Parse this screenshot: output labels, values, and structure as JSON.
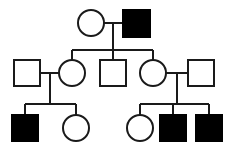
{
  "figure": {
    "type": "pedigree-chart",
    "title": "",
    "caption": "",
    "background_color": "#ffffff",
    "line_color": "#1a1a1a",
    "affected_fill": "#000000",
    "unaffected_fill": "#ffffff"
  },
  "legend": {
    "square_meaning": "male",
    "circle_meaning": "female",
    "filled_meaning": "affected",
    "open_meaning": "unaffected"
  },
  "generations": [
    {
      "id": "I",
      "label": "I",
      "y": 23,
      "individuals": [
        {
          "id": "I-1",
          "sex": "female",
          "shape": "circle",
          "affected": false,
          "cx": 91,
          "cy": 23,
          "r": 13
        },
        {
          "id": "I-2",
          "sex": "male",
          "shape": "square",
          "affected": true,
          "x": 123,
          "y": 10,
          "size": 27
        }
      ],
      "matings": [
        {
          "id": "mating-I",
          "partners": [
            "I-1",
            "I-2"
          ],
          "line_y": 23,
          "x1": 104,
          "x2": 123,
          "descent_x": 113,
          "descent_y1": 23,
          "descent_y2": 50
        }
      ],
      "sibship_line": {
        "y": 50,
        "x1": 72,
        "x2": 153,
        "children": [
          "II-2",
          "II-3",
          "II-4"
        ]
      }
    },
    {
      "id": "II",
      "label": "II",
      "y": 73,
      "individuals": [
        {
          "id": "II-1",
          "sex": "male",
          "shape": "square",
          "affected": false,
          "x": 14,
          "y": 60,
          "size": 26,
          "role": "married-in"
        },
        {
          "id": "II-2",
          "sex": "female",
          "shape": "circle",
          "affected": false,
          "cx": 72,
          "cy": 73,
          "r": 13,
          "role": "child"
        },
        {
          "id": "II-3",
          "sex": "male",
          "shape": "square",
          "affected": false,
          "x": 100,
          "y": 60,
          "size": 26,
          "role": "child"
        },
        {
          "id": "II-4",
          "sex": "female",
          "shape": "circle",
          "affected": false,
          "cx": 153,
          "cy": 73,
          "r": 13,
          "role": "child"
        },
        {
          "id": "II-5",
          "sex": "male",
          "shape": "square",
          "affected": false,
          "x": 188,
          "y": 60,
          "size": 26,
          "role": "married-in"
        }
      ],
      "matings": [
        {
          "id": "mating-II-left",
          "partners": [
            "II-1",
            "II-2"
          ],
          "line_y": 73,
          "x1": 40,
          "x2": 59,
          "descent_x": 50,
          "descent_y1": 73,
          "descent_y2": 104
        },
        {
          "id": "mating-II-right",
          "partners": [
            "II-4",
            "II-5"
          ],
          "line_y": 73,
          "x1": 166,
          "x2": 188,
          "descent_x": 177,
          "descent_y1": 73,
          "descent_y2": 104
        }
      ],
      "sibship_lines": [
        {
          "id": "sibship-II-left",
          "y": 104,
          "x1": 25,
          "x2": 76,
          "children": [
            "III-1",
            "III-2"
          ]
        },
        {
          "id": "sibship-II-right",
          "y": 104,
          "x1": 140,
          "x2": 209,
          "children": [
            "III-3",
            "III-4",
            "III-5"
          ]
        }
      ]
    },
    {
      "id": "III",
      "label": "III",
      "y": 128,
      "individuals": [
        {
          "id": "III-1",
          "sex": "male",
          "shape": "square",
          "affected": true,
          "x": 12,
          "y": 115,
          "size": 26
        },
        {
          "id": "III-2",
          "sex": "female",
          "shape": "circle",
          "affected": false,
          "cx": 76,
          "cy": 128,
          "r": 13
        },
        {
          "id": "III-3",
          "sex": "female",
          "shape": "circle",
          "affected": false,
          "cx": 140,
          "cy": 128,
          "r": 13
        },
        {
          "id": "III-4",
          "sex": "male",
          "shape": "square",
          "affected": true,
          "x": 160,
          "y": 115,
          "size": 26
        },
        {
          "id": "III-5",
          "sex": "male",
          "shape": "square",
          "affected": true,
          "x": 196,
          "y": 115,
          "size": 26
        }
      ]
    }
  ],
  "drop_lines": [
    {
      "id": "drop-II-2",
      "x": 72,
      "y1": 50,
      "y2": 60
    },
    {
      "id": "drop-II-3",
      "x": 113,
      "y1": 50,
      "y2": 60
    },
    {
      "id": "drop-II-4",
      "x": 153,
      "y1": 50,
      "y2": 60
    },
    {
      "id": "drop-III-1",
      "x": 25,
      "y1": 104,
      "y2": 115
    },
    {
      "id": "drop-III-2",
      "x": 76,
      "y1": 104,
      "y2": 115
    },
    {
      "id": "drop-III-3",
      "x": 140,
      "y1": 104,
      "y2": 115
    },
    {
      "id": "drop-III-4",
      "x": 173,
      "y1": 104,
      "y2": 115
    },
    {
      "id": "drop-III-5",
      "x": 209,
      "y1": 104,
      "y2": 115
    }
  ],
  "counts": {
    "total_individuals": 12,
    "affected": 4,
    "unaffected": 8,
    "males": 7,
    "females": 5,
    "generations": 3
  }
}
